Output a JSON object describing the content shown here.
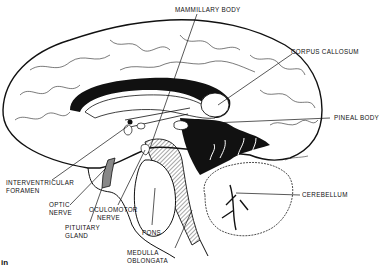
{
  "diagram": {
    "labels": {
      "mammillary_body": "MAMMILLARY BODY",
      "corpus_callosum": "CORPUS CALLOSUM",
      "pineal_body": "PINEAL BODY",
      "cerebellum": "CEREBELLUM",
      "interventricular_foramen_1": "INTERVENTRICULAR",
      "interventricular_foramen_2": "FORAMEN",
      "optic_nerve_1": "OPTIC",
      "optic_nerve_2": "NERVE",
      "oculomotor_nerve_1": "OCULOMOTOR",
      "oculomotor_nerve_2": "NERVE",
      "pituitary_gland_1": "PITUITARY",
      "pituitary_gland_2": "GLAND",
      "pons": "PONS",
      "medulla_oblongata_1": "MEDULLA",
      "medulla_oblongata_2": "OBLONGATA"
    },
    "caption_fragment": "in",
    "colors": {
      "ink": "#111111",
      "background": "#ffffff",
      "shade": "#777777"
    }
  }
}
